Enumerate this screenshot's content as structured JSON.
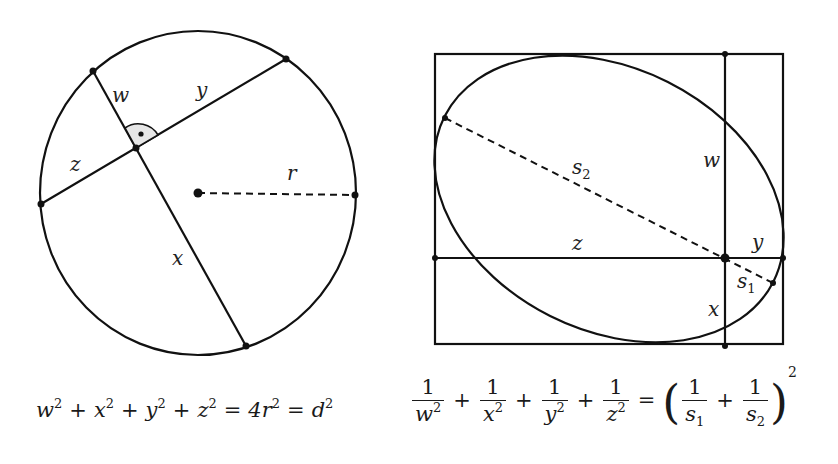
{
  "figure_left": {
    "title": "Perpendicular chords in a circle",
    "labels": {
      "w": "w",
      "x": "x",
      "y": "y",
      "z": "z",
      "r": "r"
    },
    "right_angle_marker": true
  },
  "figure_right": {
    "title": "Ellipse inscribed in a rectangle",
    "labels": {
      "w": "w",
      "x": "x",
      "y": "y",
      "z": "z",
      "s2_base": "s",
      "s2_sub": "2",
      "s1_base": "s",
      "s1_sub": "1"
    }
  },
  "formula_left": {
    "terms": [
      "w",
      "x",
      "y",
      "z"
    ],
    "exponent": "2",
    "plus": "+",
    "equals": "=",
    "middle": "4r",
    "right": "d"
  },
  "formula_right": {
    "numerator": "1",
    "denominators": [
      "w",
      "x",
      "y",
      "z"
    ],
    "exponent": "2",
    "plus": "+",
    "equals": "=",
    "rhs_den1_base": "s",
    "rhs_den1_sub": "1",
    "rhs_den2_base": "s",
    "rhs_den2_sub": "2",
    "open_paren": "(",
    "close_paren": ")"
  }
}
